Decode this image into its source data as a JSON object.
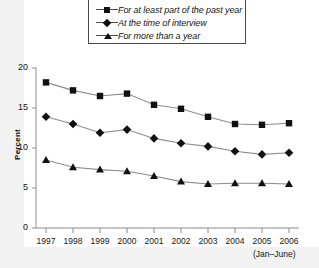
{
  "chart_data": {
    "type": "line",
    "title": "",
    "xlabel": "",
    "ylabel": "Percent",
    "ylim": [
      0,
      20
    ],
    "yticks": [
      0,
      5,
      10,
      15,
      20
    ],
    "grid": false,
    "legend_position": "top",
    "x_note": "(Jan–June)",
    "categories": [
      "1997",
      "1998",
      "1999",
      "2000",
      "2001",
      "2002",
      "2003",
      "2004",
      "2005",
      "2006"
    ],
    "series": [
      {
        "name": "For at least part of the past year",
        "marker": "square",
        "values": [
          18.2,
          17.2,
          16.5,
          16.8,
          15.4,
          14.9,
          13.9,
          13.0,
          12.9,
          13.1
        ]
      },
      {
        "name": "At the time of interview",
        "marker": "diamond",
        "values": [
          13.9,
          13.0,
          11.9,
          12.3,
          11.2,
          10.6,
          10.2,
          9.6,
          9.2,
          9.4
        ]
      },
      {
        "name": "For more than a year",
        "marker": "triangle",
        "values": [
          8.5,
          7.6,
          7.3,
          7.1,
          6.5,
          5.8,
          5.5,
          5.6,
          5.6,
          5.5
        ]
      }
    ]
  },
  "legend": {
    "items": [
      {
        "label": "For at least part of the past year",
        "marker": "square-marker-icon"
      },
      {
        "label": "At the time of interview",
        "marker": "diamond-marker-icon"
      },
      {
        "label": "For more than a year",
        "marker": "triangle-marker-icon"
      }
    ]
  },
  "axes": {
    "y_label": "Percent",
    "y_ticks": [
      "0",
      "5",
      "10",
      "15",
      "20"
    ],
    "x_ticks": [
      "1997",
      "1998",
      "1999",
      "2000",
      "2001",
      "2002",
      "2003",
      "2004",
      "2005",
      "2006"
    ],
    "x_note": "(Jan–June)"
  },
  "colors": {
    "line": "#8c8c8c",
    "marker": "#111111",
    "axis": "#8c8c8c",
    "text": "#141414",
    "page_background": "#f2f2f2",
    "plot_background": "#ffffff"
  }
}
